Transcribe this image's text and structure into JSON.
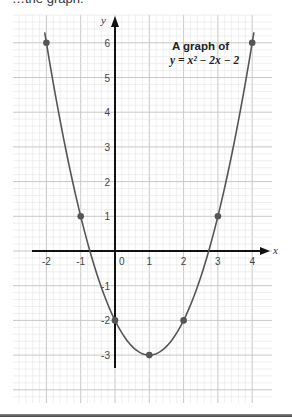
{
  "caption_partial": "…the graph.",
  "chart_data": {
    "type": "line",
    "title": "A graph of",
    "equation": "y = x² − 2x − 2",
    "xlabel": "x",
    "ylabel": "y",
    "xlim": [
      -2.5,
      4.5
    ],
    "ylim": [
      -4.5,
      6.8
    ],
    "x_ticks": [
      -2,
      -1,
      0,
      1,
      2,
      3,
      4
    ],
    "y_ticks": [
      -3,
      -2,
      -1,
      1,
      2,
      3,
      4,
      5,
      6
    ],
    "grid": true,
    "x": [
      -2,
      -1,
      0,
      1,
      2,
      3,
      4
    ],
    "values": [
      6,
      1,
      -2,
      -3,
      -2,
      1,
      6
    ],
    "series": [
      {
        "name": "y = x^2 - 2x - 2",
        "x": [
          -2,
          -1,
          0,
          1,
          2,
          3,
          4
        ],
        "values": [
          6,
          1,
          -2,
          -3,
          -2,
          1,
          6
        ]
      }
    ],
    "colors": {
      "curve": "#555555",
      "points": "#555555",
      "axes": "#111111",
      "grid_major": "#c8c8c8",
      "grid_minor": "#e4e4e4"
    }
  },
  "labels": {
    "title_line1": "A graph of",
    "title_line2": "y = x² − 2x − 2",
    "x_axis": "x",
    "y_axis": "y",
    "x_ticks": [
      "-2",
      "-1",
      "0",
      "1",
      "2",
      "3",
      "4"
    ],
    "y_ticks": [
      "6",
      "5",
      "4",
      "3",
      "2",
      "1",
      "-1",
      "-2",
      "-3"
    ]
  }
}
